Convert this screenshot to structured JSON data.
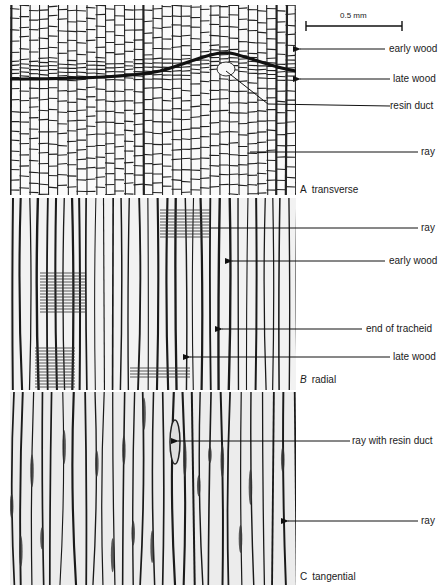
{
  "figure": {
    "scale_bar": {
      "label": "0.5 mm"
    },
    "panels": [
      {
        "letter": "A",
        "name": "transverse",
        "labels": [
          "early wood",
          "late wood",
          "resin duct",
          "ray"
        ]
      },
      {
        "letter": "B",
        "name": "radial",
        "labels": [
          "ray",
          "early wood",
          "end of tracheid",
          "late wood"
        ]
      },
      {
        "letter": "C",
        "name": "tangential",
        "labels": [
          "ray with resin duct",
          "ray"
        ]
      }
    ]
  }
}
